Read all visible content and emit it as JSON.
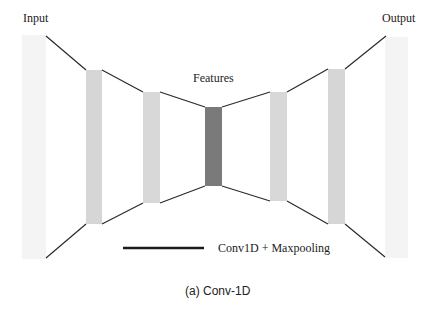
{
  "diagram": {
    "title": "(a) Conv-1D",
    "labels": {
      "input": "Input",
      "output": "Output",
      "features": "Features"
    },
    "legend": {
      "line_label": "Conv1D + Maxpooling",
      "line_color": "#1a1a1a"
    },
    "colors": {
      "io_bar": "#f4f4f4",
      "hidden_bar": "#d6d6d6",
      "feature_bar": "#7a7a7a",
      "connector": "#2a2a2a"
    },
    "layers": [
      {
        "name": "input",
        "x": 22,
        "top": 35,
        "bottom": 259,
        "width": 24
      },
      {
        "name": "encoder-1",
        "x": 86,
        "top": 70,
        "bottom": 224,
        "width": 16
      },
      {
        "name": "encoder-2",
        "x": 143,
        "top": 92,
        "bottom": 203,
        "width": 17
      },
      {
        "name": "features",
        "x": 205,
        "top": 107,
        "bottom": 186,
        "width": 17
      },
      {
        "name": "decoder-1",
        "x": 270,
        "top": 92,
        "bottom": 201,
        "width": 17
      },
      {
        "name": "decoder-2",
        "x": 328,
        "top": 69,
        "bottom": 224,
        "width": 17
      },
      {
        "name": "output",
        "x": 385,
        "top": 37,
        "bottom": 258,
        "width": 23
      }
    ]
  }
}
